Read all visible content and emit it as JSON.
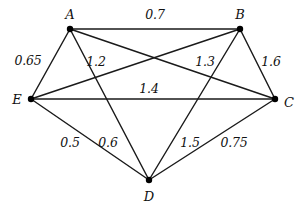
{
  "chart_data": {
    "type": "diagram",
    "title": "",
    "graph_kind": "weighted-undirected-complete-graph",
    "nodes": [
      {
        "id": "A",
        "label": "A",
        "x": 70,
        "y": 29,
        "label_x": 70,
        "label_y": 14
      },
      {
        "id": "B",
        "label": "B",
        "x": 240,
        "y": 29,
        "label_x": 240,
        "label_y": 14
      },
      {
        "id": "C",
        "label": "C",
        "x": 275,
        "y": 99,
        "label_x": 289,
        "label_y": 102
      },
      {
        "id": "D",
        "label": "D",
        "x": 149,
        "y": 180,
        "label_x": 149,
        "label_y": 196
      },
      {
        "id": "E",
        "label": "E",
        "x": 31,
        "y": 99,
        "label_x": 17,
        "label_y": 99
      }
    ],
    "edges": [
      {
        "source": "A",
        "target": "B",
        "weight": "0.7",
        "value": 0.7,
        "label_x": 155,
        "label_y": 15
      },
      {
        "source": "A",
        "target": "E",
        "weight": "0.65",
        "value": 0.65,
        "label_x": 28,
        "label_y": 61
      },
      {
        "source": "A",
        "target": "D",
        "weight": "1.2",
        "value": 1.2,
        "label_x": 96,
        "label_y": 62
      },
      {
        "source": "A",
        "target": "C",
        "weight": "",
        "value": null,
        "label_x": 0,
        "label_y": 0
      },
      {
        "source": "B",
        "target": "E",
        "weight": "1.3",
        "value": 1.3,
        "label_x": 205,
        "label_y": 62
      },
      {
        "source": "B",
        "target": "C",
        "weight": "1.6",
        "value": 1.6,
        "label_x": 271,
        "label_y": 62
      },
      {
        "source": "B",
        "target": "D",
        "weight": "1.5",
        "value": 1.5,
        "label_x": 190,
        "label_y": 143
      },
      {
        "source": "E",
        "target": "C",
        "weight": "1.4",
        "value": 1.4,
        "label_x": 149,
        "label_y": 89
      },
      {
        "source": "E",
        "target": "D",
        "weight": "0.5",
        "value": 0.5,
        "label_x": 70,
        "label_y": 143
      },
      {
        "source": "C",
        "target": "D",
        "weight": "0.75",
        "value": 0.75,
        "label_x": 234,
        "label_y": 143
      }
    ],
    "extra_weight_labels": [
      {
        "weight": "0.6",
        "value": 0.6,
        "label_x": 108,
        "label_y": 143
      }
    ],
    "colors": {
      "background": "#ffffff",
      "edge": "#1a1a1a",
      "vertex": "#000000",
      "text": "#111111"
    }
  }
}
